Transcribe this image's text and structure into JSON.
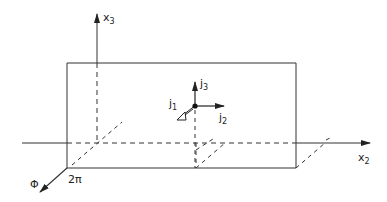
{
  "diagram": {
    "axes": {
      "x3": {
        "label": "x",
        "sub": "3"
      },
      "x2": {
        "label": "x",
        "sub": "2"
      },
      "phi": {
        "label": "Φ",
        "tick": "2π"
      }
    },
    "vectors": {
      "j1": {
        "label": "j",
        "sub": "1"
      },
      "j2": {
        "label": "j",
        "sub": "2"
      },
      "j3": {
        "label": "j",
        "sub": "3"
      }
    },
    "colors": {
      "stroke": "#333333",
      "background": "#ffffff"
    }
  }
}
